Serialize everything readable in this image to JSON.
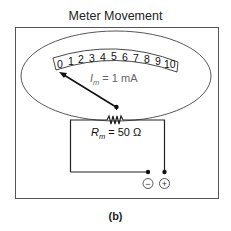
{
  "title": "Meter Movement",
  "caption": "(b)",
  "scale": {
    "ticks": [
      "0",
      "1",
      "2",
      "3",
      "4",
      "5",
      "6",
      "7",
      "8",
      "9",
      "10"
    ]
  },
  "current_label": {
    "symbol": "I",
    "subscript": "m",
    "value": " = 1 mA"
  },
  "resistance_label": {
    "symbol": "R",
    "subscript": "m",
    "value": " = 50 Ω"
  },
  "terminals": {
    "negative": "−",
    "positive": "+"
  },
  "colors": {
    "line": "#222222",
    "label_gray": "#666666",
    "border_gray": "#555555"
  }
}
